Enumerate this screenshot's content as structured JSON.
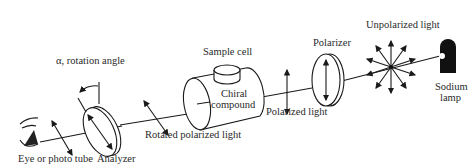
{
  "diagram": {
    "components": {
      "source": {
        "label_line1": "Sodium",
        "label_line2": "lamp"
      },
      "unpolarized_light": {
        "label": "Unpolarized light"
      },
      "polarizer": {
        "label": "Polarizer"
      },
      "polarized_light": {
        "label": "Polarized light"
      },
      "sample_cell": {
        "label": "Sample cell",
        "content_line1": "Chiral",
        "content_line2": "compound"
      },
      "rotated_light": {
        "label": "Rotated polarized light"
      },
      "analyzer": {
        "label": "Analyzer"
      },
      "rotation_angle": {
        "label": "α, rotation angle"
      },
      "detector": {
        "label": "Eye or photo tube"
      }
    },
    "flow": [
      "Sodium lamp",
      "Unpolarized light",
      "Polarizer",
      "Polarized light",
      "Sample cell",
      "Rotated polarized light",
      "Analyzer",
      "Eye or photo tube"
    ],
    "colors": {
      "ink": "#1a1a1a",
      "background": "#ffffff"
    }
  }
}
